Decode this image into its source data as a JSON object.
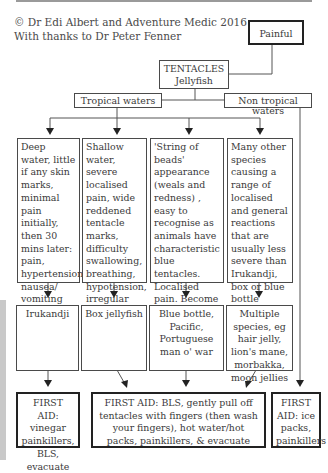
{
  "credit": {
    "line1": "© Dr Edi Albert and Adventure Medic 2016",
    "line2": "With thanks to Dr Peter Fenner"
  },
  "nodes": {
    "painful": "Painful",
    "tentacles": {
      "line1": "TENTACLES",
      "line2": "Jellyfish"
    },
    "tropical": "Tropical waters",
    "non_tropical": "Non tropical waters"
  },
  "symptoms": [
    {
      "id": "irukandji",
      "text": "Deep water, little if any skin marks, minimal pain initially, then 30 mins later: pain, hypertension, nausea/ vomiting"
    },
    {
      "id": "box-jellyfish",
      "text": "Shallow water, severe localised pain, wide reddened tentacle marks, difficulty swallowing, breathing, hypotension, irregular heart beat"
    },
    {
      "id": "blue-bottle",
      "text": "'String of beads' appearance (weals and redness) , easy to recognise as animals have characteristic blue tentacles. Localised pain. Become unwell if stung by multiple tentacles"
    },
    {
      "id": "multiple-species",
      "text": "Many other species causing a range of localised and general reactions that are usually less severe than Irukandji, box or blue bottle stings"
    }
  ],
  "species": [
    {
      "id": "irukandji",
      "text": "Irukandji"
    },
    {
      "id": "box-jellyfish",
      "text": "Box jellyfish"
    },
    {
      "id": "blue-bottle",
      "text": "Blue bottle, Pacific, Portuguese man o' war"
    },
    {
      "id": "multiple-species",
      "text": "Multiple species, eg hair jelly, lion's mane, morbakka, moon jellies"
    }
  ],
  "first_aid": [
    {
      "id": "irukandji",
      "text": "FIRST AID: vinegar painkillers, BLS, evacuate"
    },
    {
      "id": "general",
      "text": "FIRST AID: BLS, gently pull off tentacles with fingers (then wash your fingers), hot water/hot packs, painkillers, & evacuate"
    },
    {
      "id": "non-tropical",
      "text": "FIRST AID: ice packs, painkillers"
    }
  ]
}
